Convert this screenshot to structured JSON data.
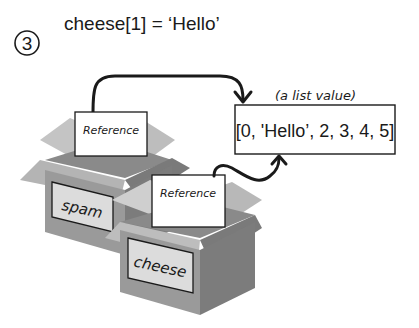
{
  "step": {
    "number": "3",
    "code": "cheese[1] = ‘Hello’"
  },
  "list_value": {
    "caption": "(a list value)",
    "contents": "[0, 'Hello’, 2, 3, 4, 5]"
  },
  "variables": [
    {
      "name": "spam",
      "card_label": "Reference"
    },
    {
      "name": "cheese",
      "card_label": "Reference"
    }
  ],
  "colors": {
    "box_front": "#9a9a9a",
    "box_side": "#7c7c7c",
    "box_flap_light": "#c9c9c9",
    "box_flap_mid": "#b0b0b0",
    "box_inner": "#8a8a8a",
    "label_bg": "#dcdcdc",
    "ink": "#1a1a1a"
  }
}
